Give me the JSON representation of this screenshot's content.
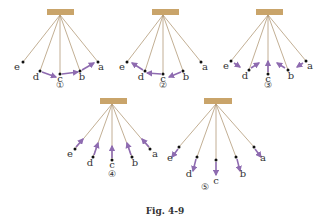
{
  "caption": "Fig. 4-9",
  "colors": {
    "bar": "#c9a46a",
    "string": "#b39a78",
    "arrow": "#8e6bb0",
    "dot": "#111111",
    "text": "#333333"
  },
  "diagrams": [
    {
      "number": "①",
      "pivot": [
        60,
        15
      ],
      "bar": [
        47,
        9,
        27,
        6
      ],
      "numpos": [
        60,
        88
      ],
      "points": [
        {
          "label": "e",
          "pos": [
            23,
            62
          ],
          "lpos": [
            17,
            70
          ]
        },
        {
          "label": "d",
          "pos": [
            40,
            71
          ],
          "lpos": [
            36,
            80
          ]
        },
        {
          "label": "c",
          "pos": [
            60,
            74
          ],
          "lpos": [
            60,
            82
          ]
        },
        {
          "label": "b",
          "pos": [
            80,
            71
          ],
          "lpos": [
            82,
            80
          ]
        },
        {
          "label": "a",
          "pos": [
            98,
            62
          ],
          "lpos": [
            101,
            70
          ]
        }
      ],
      "arrows": [
        {
          "from": [
            42,
            72
          ],
          "to": [
            56,
            77
          ]
        },
        {
          "from": [
            62,
            74
          ],
          "to": [
            78,
            72
          ]
        },
        {
          "from": [
            82,
            70
          ],
          "to": [
            94,
            63
          ]
        }
      ]
    },
    {
      "number": "②",
      "pivot": [
        163,
        15
      ],
      "bar": [
        152,
        9,
        27,
        6
      ],
      "numpos": [
        163,
        88
      ],
      "points": [
        {
          "label": "e",
          "pos": [
            127,
            62
          ],
          "lpos": [
            122,
            70
          ]
        },
        {
          "label": "d",
          "pos": [
            145,
            71
          ],
          "lpos": [
            141,
            80
          ]
        },
        {
          "label": "c",
          "pos": [
            163,
            74
          ],
          "lpos": [
            163,
            82
          ]
        },
        {
          "label": "b",
          "pos": [
            183,
            71
          ],
          "lpos": [
            186,
            80
          ]
        },
        {
          "label": "a",
          "pos": [
            201,
            62
          ],
          "lpos": [
            205,
            70
          ]
        }
      ],
      "arrows": [
        {
          "from": [
            143,
            70
          ],
          "to": [
            132,
            63
          ]
        },
        {
          "from": [
            161,
            74
          ],
          "to": [
            147,
            73
          ]
        },
        {
          "from": [
            181,
            72
          ],
          "to": [
            169,
            77
          ]
        }
      ]
    },
    {
      "number": "③",
      "pivot": [
        268,
        15
      ],
      "bar": [
        256,
        9,
        27,
        6
      ],
      "numpos": [
        268,
        88
      ],
      "points": [
        {
          "label": "e",
          "pos": [
            231,
            61
          ],
          "lpos": [
            226,
            69
          ]
        },
        {
          "label": "d",
          "pos": [
            249,
            70
          ],
          "lpos": [
            245,
            79
          ]
        },
        {
          "label": "c",
          "pos": [
            268,
            74
          ],
          "lpos": [
            268,
            82
          ]
        },
        {
          "label": "b",
          "pos": [
            288,
            70
          ],
          "lpos": [
            291,
            79
          ]
        },
        {
          "label": "a",
          "pos": [
            306,
            61
          ],
          "lpos": [
            310,
            69
          ]
        }
      ],
      "arrows": [
        {
          "from": [
            234,
            63
          ],
          "to": [
            240,
            67
          ]
        },
        {
          "from": [
            251,
            68
          ],
          "to": [
            259,
            63
          ]
        },
        {
          "from": [
            268,
            72
          ],
          "to": [
            268,
            61
          ]
        },
        {
          "from": [
            285,
            68
          ],
          "to": [
            277,
            63
          ]
        },
        {
          "from": [
            303,
            63
          ],
          "to": [
            297,
            67
          ]
        }
      ]
    },
    {
      "number": "④",
      "pivot": [
        112,
        104
      ],
      "bar": [
        100,
        98,
        27,
        6
      ],
      "numpos": [
        112,
        177
      ],
      "points": [
        {
          "label": "e",
          "pos": [
            75,
            149
          ],
          "lpos": [
            70,
            157
          ]
        },
        {
          "label": "d",
          "pos": [
            93,
            157
          ],
          "lpos": [
            90,
            166
          ]
        },
        {
          "label": "c",
          "pos": [
            112,
            160
          ],
          "lpos": [
            112,
            168
          ]
        },
        {
          "label": "b",
          "pos": [
            132,
            157
          ],
          "lpos": [
            135,
            166
          ]
        },
        {
          "label": "a",
          "pos": [
            150,
            149
          ],
          "lpos": [
            155,
            157
          ]
        }
      ],
      "arrows": [
        {
          "from": [
            76,
            147
          ],
          "to": [
            83,
            139
          ]
        },
        {
          "from": [
            94,
            155
          ],
          "to": [
            98,
            143
          ]
        },
        {
          "from": [
            112,
            158
          ],
          "to": [
            112,
            146
          ]
        },
        {
          "from": [
            131,
            155
          ],
          "to": [
            127,
            143
          ]
        },
        {
          "from": [
            149,
            147
          ],
          "to": [
            142,
            139
          ]
        }
      ]
    },
    {
      "number": "⑤",
      "pivot": [
        216,
        104
      ],
      "bar": [
        204,
        98,
        28,
        6
      ],
      "numpos": [
        205,
        190
      ],
      "points": [
        {
          "label": "e",
          "pos": [
            179,
            147
          ],
          "lpos": [
            170,
            161
          ]
        },
        {
          "label": "d",
          "pos": [
            197,
            157
          ],
          "lpos": [
            189,
            177
          ]
        },
        {
          "label": "c",
          "pos": [
            216,
            160
          ],
          "lpos": [
            216,
            184
          ]
        },
        {
          "label": "b",
          "pos": [
            236,
            157
          ],
          "lpos": [
            243,
            177
          ]
        },
        {
          "label": "a",
          "pos": [
            254,
            147
          ],
          "lpos": [
            263,
            161
          ]
        }
      ],
      "arrows": [
        {
          "from": [
            178,
            149
          ],
          "to": [
            172,
            157
          ]
        },
        {
          "from": [
            196,
            159
          ],
          "to": [
            193,
            171
          ]
        },
        {
          "from": [
            216,
            162
          ],
          "to": [
            216,
            175
          ]
        },
        {
          "from": [
            237,
            159
          ],
          "to": [
            240,
            171
          ]
        },
        {
          "from": [
            255,
            149
          ],
          "to": [
            261,
            157
          ]
        }
      ]
    }
  ]
}
